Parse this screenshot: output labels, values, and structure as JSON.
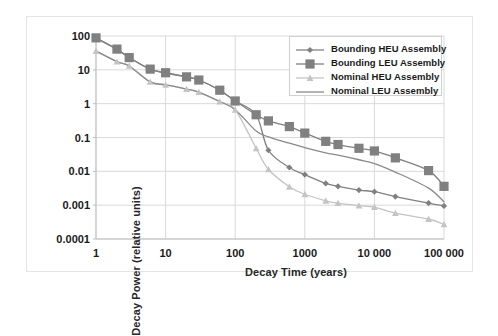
{
  "chart_data": {
    "type": "line",
    "title": "",
    "xlabel": "Decay Time (years)",
    "ylabel": "Decay Power (relative units)",
    "xscale": "log",
    "yscale": "log",
    "xlim": [
      1,
      100000
    ],
    "ylim": [
      0.0001,
      100
    ],
    "grid": true,
    "legend_position": "top-right",
    "xticks": [
      "1",
      "10",
      "100",
      "1000",
      "10 000",
      "100 000"
    ],
    "xtick_values": [
      1,
      10,
      100,
      1000,
      10000,
      100000
    ],
    "yticks": [
      "100",
      "10",
      "1",
      "0.1",
      "0.01",
      "0.001",
      "0.0001"
    ],
    "ytick_values": [
      100,
      10,
      1,
      0.1,
      0.01,
      0.001,
      0.0001
    ],
    "series": [
      {
        "name": "Bounding HEU Assembly",
        "color": "#808080",
        "marker": "diamond",
        "marker_size": 3.1,
        "x": [
          1,
          2,
          3,
          6,
          10,
          20,
          30,
          60,
          100,
          200,
          300,
          600,
          1000,
          2000,
          3000,
          6000,
          10000,
          20000,
          60000,
          100000
        ],
        "y": [
          85,
          40,
          23,
          10.5,
          8.0,
          6.2,
          5.0,
          2.5,
          1.2,
          0.47,
          0.042,
          0.013,
          0.008,
          0.0044,
          0.0036,
          0.0028,
          0.0025,
          0.0018,
          0.00115,
          0.00095
        ]
      },
      {
        "name": "Bounding LEU Assembly",
        "color": "#808080",
        "marker": "square",
        "marker_size": 4.6,
        "x": [
          1,
          2,
          3,
          6,
          10,
          20,
          30,
          60,
          100,
          200,
          300,
          600,
          1000,
          2000,
          3000,
          6000,
          10000,
          20000,
          60000,
          100000
        ],
        "y": [
          88,
          41,
          23,
          10.5,
          8.2,
          6.2,
          5.0,
          2.5,
          1.2,
          0.47,
          0.31,
          0.21,
          0.135,
          0.077,
          0.062,
          0.048,
          0.04,
          0.025,
          0.0105,
          0.0036
        ]
      },
      {
        "name": "Nominal HEU Assembly",
        "color": "#c4c4c4",
        "marker": "triangle",
        "marker_size": 3.4,
        "x": [
          1,
          2,
          3,
          6,
          10,
          20,
          30,
          60,
          100,
          200,
          300,
          600,
          1000,
          2000,
          3000,
          6000,
          10000,
          20000,
          60000,
          100000
        ],
        "y": [
          36,
          17.5,
          13.0,
          4.4,
          3.6,
          2.7,
          2.2,
          1.15,
          0.66,
          0.048,
          0.0115,
          0.0035,
          0.0021,
          0.00135,
          0.00115,
          0.00097,
          0.00087,
          0.00058,
          0.00039,
          0.00027
        ]
      },
      {
        "name": "Nominal LEU Assembly",
        "color": "#8a8a8a",
        "marker": "none",
        "marker_size": 0,
        "x": [
          1,
          2,
          3,
          6,
          10,
          20,
          30,
          60,
          100,
          200,
          300,
          600,
          1000,
          2000,
          3000,
          6000,
          10000,
          20000,
          60000,
          100000
        ],
        "y": [
          36,
          17.5,
          13.0,
          4.4,
          3.6,
          2.7,
          2.2,
          1.15,
          0.66,
          0.155,
          0.105,
          0.068,
          0.05,
          0.035,
          0.03,
          0.022,
          0.017,
          0.0095,
          0.0032,
          0.00125
        ]
      }
    ]
  },
  "legend": {
    "items": [
      {
        "label": "Bounding HEU Assembly"
      },
      {
        "label": "Bounding LEU Assembly"
      },
      {
        "label": "Nominal HEU Assembly"
      },
      {
        "label": "Nominal LEU Assembly"
      }
    ]
  },
  "style": {
    "grid_color": "#d9d9d9",
    "axis_color": "#bfbfbf",
    "frame_color": "#e4e4e4",
    "text_color": "#1a1a1a"
  }
}
